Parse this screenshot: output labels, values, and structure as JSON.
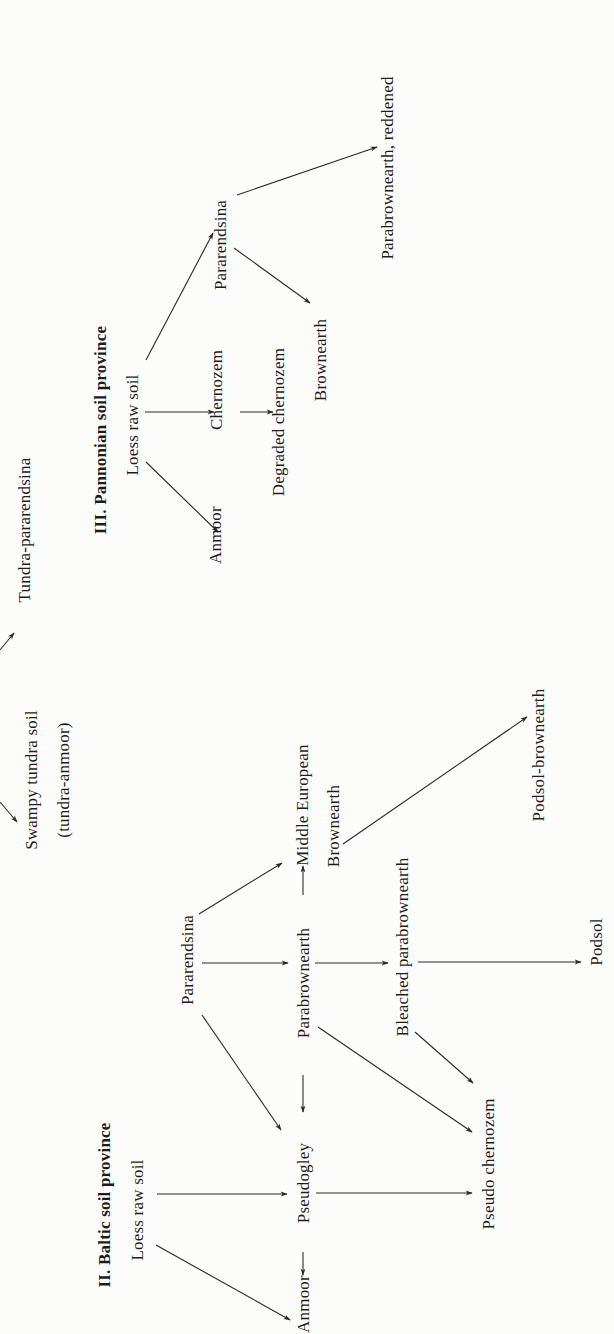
{
  "figure": {
    "orientation": "rotated-90-ccw",
    "sections": [
      {
        "id": "tundra",
        "labels": {
          "tundra_pararendsina": "Tundra-pararendsina",
          "swampy_tundra_soil": "Swampy tundra soil",
          "tundra_anmoor": "(tundra-anmoor)"
        }
      },
      {
        "id": "pannonian",
        "title": "III. Pannonian soil province",
        "labels": {
          "loess_raw_soil": "Loess raw soil",
          "anmoor": "Anmoor",
          "chernozem": "Chernozem",
          "degraded_chernozem": "Degraded chernozem",
          "pararendsina": "Pararendsina",
          "brownearth": "Brownearth",
          "parabrownearth_reddened": "Parabrownearth, reddened"
        }
      },
      {
        "id": "baltic",
        "title": "II. Baltic soil province",
        "labels": {
          "loess_raw_soil": "Loess raw soil",
          "anmoor": "Anmoor",
          "pseudogley": "Pseudogley",
          "pararendsina": "Pararendsina",
          "parabrownearth": "Parabrownearth",
          "middle_european": "Middle European",
          "brownearth": "Brownearth",
          "bleached_parabrownearth": "Bleached parabrownearth",
          "pseudo_chernozem": "Pseudo chernozem",
          "podsol": "Podsol",
          "podsol_brownearth": "Podsol-brownearth"
        }
      }
    ],
    "edges": [
      {
        "from": "III.Loess raw soil",
        "to": "III.Anmoor"
      },
      {
        "from": "III.Loess raw soil",
        "to": "III.Chernozem"
      },
      {
        "from": "III.Loess raw soil",
        "to": "III.Pararendsina"
      },
      {
        "from": "III.Chernozem",
        "to": "III.Degraded chernozem"
      },
      {
        "from": "III.Pararendsina",
        "to": "III.Brownearth"
      },
      {
        "from": "III.Pararendsina",
        "to": "III.Parabrownearth, reddened"
      },
      {
        "from": "II.Loess raw soil",
        "to": "II.Anmoor"
      },
      {
        "from": "II.Loess raw soil",
        "to": "II.Pseudogley"
      },
      {
        "from": "II.Pseudogley",
        "to": "II.Anmoor"
      },
      {
        "from": "II.Pseudogley",
        "to": "II.Pseudo chernozem"
      },
      {
        "from": "II.Pararendsina",
        "to": "II.Pseudogley"
      },
      {
        "from": "II.Pararendsina",
        "to": "II.Parabrownearth"
      },
      {
        "from": "II.Pararendsina",
        "to": "II.Middle European Brownearth"
      },
      {
        "from": "II.Parabrownearth",
        "to": "II.Pseudogley"
      },
      {
        "from": "II.Parabrownearth",
        "to": "II.Middle European Brownearth"
      },
      {
        "from": "II.Parabrownearth",
        "to": "II.Bleached parabrownearth"
      },
      {
        "from": "II.Parabrownearth",
        "to": "II.Pseudo chernozem"
      },
      {
        "from": "II.Bleached parabrownearth",
        "to": "II.Podsol"
      },
      {
        "from": "II.Bleached parabrownearth",
        "to": "II.Pseudo chernozem"
      },
      {
        "from": "II.Middle European Brownearth",
        "to": "II.Podsol-brownearth"
      }
    ]
  }
}
